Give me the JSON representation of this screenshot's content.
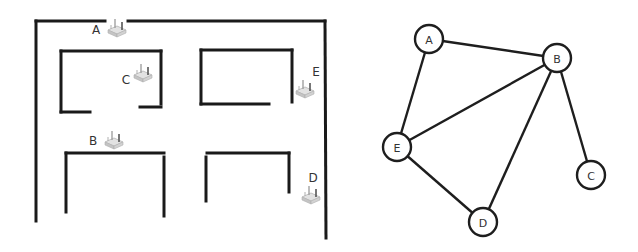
{
  "floor_plan": {
    "routers": [
      {
        "id": "A",
        "label": "A",
        "x": 117,
        "y": 28,
        "label_x": 96,
        "label_y": 30
      },
      {
        "id": "C",
        "label": "C",
        "x": 143,
        "y": 73,
        "label_x": 126,
        "label_y": 80
      },
      {
        "id": "B",
        "label": "B",
        "x": 114,
        "y": 140,
        "label_x": 93,
        "label_y": 141
      },
      {
        "id": "E",
        "label": "E",
        "x": 305,
        "y": 89,
        "label_x": 316,
        "label_y": 72
      },
      {
        "id": "D",
        "label": "D",
        "x": 311,
        "y": 195,
        "label_x": 313,
        "label_y": 178
      }
    ],
    "wall_color": "#1a1a1a",
    "router_color": "#c8c8c8"
  },
  "graph": {
    "nodes": [
      {
        "id": "A",
        "label": "A",
        "x": 429,
        "y": 39
      },
      {
        "id": "B",
        "label": "B",
        "x": 557,
        "y": 58
      },
      {
        "id": "E",
        "label": "E",
        "x": 397,
        "y": 147
      },
      {
        "id": "C",
        "label": "C",
        "x": 591,
        "y": 175
      },
      {
        "id": "D",
        "label": "D",
        "x": 483,
        "y": 222
      }
    ],
    "edges": [
      [
        "A",
        "B"
      ],
      [
        "A",
        "E"
      ],
      [
        "E",
        "B"
      ],
      [
        "B",
        "D"
      ],
      [
        "B",
        "C"
      ],
      [
        "E",
        "D"
      ]
    ],
    "node_radius": 14
  }
}
